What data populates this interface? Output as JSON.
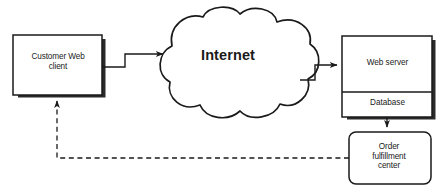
{
  "diagram": {
    "type": "network-architecture-flow",
    "canvas": {
      "width": 445,
      "height": 192,
      "background": "#ffffff"
    },
    "colors": {
      "stroke": "#1a1a1a",
      "fill": "#ffffff",
      "shadow": "#2b2b2b",
      "text": "#1a1a1a"
    },
    "nodes": [
      {
        "id": "customer-web-client",
        "label": "Customer Web\nclient",
        "shape": "rectangle-with-drop-shadow",
        "bounds": {
          "x": 13,
          "y": 35,
          "width": 89,
          "height": 60
        }
      },
      {
        "id": "internet",
        "label": "Internet",
        "shape": "cloud",
        "bounds": {
          "x": 138,
          "y": 10,
          "width": 180,
          "height": 113
        }
      },
      {
        "id": "web-server",
        "label": "Web server",
        "shape": "rectangle-with-drop-shadow",
        "bounds": {
          "x": 342,
          "y": 36,
          "width": 90,
          "height": 55
        }
      },
      {
        "id": "database",
        "label": "Database",
        "shape": "rectangle-compartment",
        "bounds": {
          "x": 342,
          "y": 91,
          "width": 90,
          "height": 26
        }
      },
      {
        "id": "order-fulfillment-center",
        "label": "Order\nfulfillment\ncenter",
        "shape": "rounded-rectangle",
        "bounds": {
          "x": 349,
          "y": 132,
          "width": 82,
          "height": 52
        }
      }
    ],
    "edges": [
      {
        "id": "client-to-internet",
        "from": "customer-web-client",
        "to": "internet",
        "style": "solid",
        "arrowhead": "end",
        "routing": "orthogonal-step-up"
      },
      {
        "id": "internet-to-web-server",
        "from": "internet",
        "to": "web-server",
        "style": "solid",
        "arrowhead": "end",
        "routing": "orthogonal-step-up"
      },
      {
        "id": "database-to-order-fulfillment",
        "from": "database",
        "to": "order-fulfillment-center",
        "style": "solid",
        "arrowhead": "end",
        "routing": "vertical"
      },
      {
        "id": "order-fulfillment-to-client",
        "from": "order-fulfillment-center",
        "to": "customer-web-client",
        "style": "dashed",
        "arrowhead": "end",
        "routing": "orthogonal-left-then-up"
      }
    ]
  }
}
